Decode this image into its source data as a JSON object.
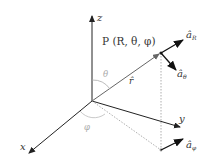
{
  "diagram": {
    "axes": {
      "z": "z",
      "y": "y",
      "x": "x"
    },
    "point_label": "P (R, θ, φ)",
    "vector_label": "r̂",
    "angles": {
      "theta": "θ",
      "phi": "φ"
    },
    "unit_vectors": {
      "a_R": "â",
      "a_R_sub": "R",
      "a_theta": "â",
      "a_theta_sub": "θ",
      "a_phi": "â",
      "a_phi_sub": "φ"
    },
    "colors": {
      "axis": "#222222",
      "vector": "#555555",
      "angle_arc": "#aaaaaa",
      "dotted": "#999999"
    }
  }
}
